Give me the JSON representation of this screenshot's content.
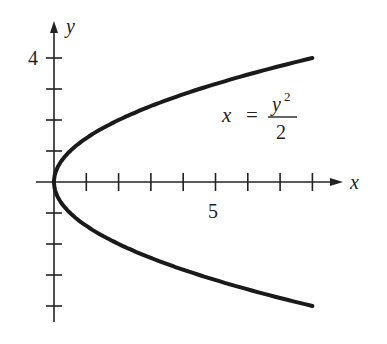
{
  "chart_data": {
    "type": "line",
    "title": "",
    "equation": {
      "lhs": "x",
      "eq": "=",
      "numerator": "y",
      "exponent": "2",
      "denominator": "2"
    },
    "xlabel": "x",
    "ylabel": "y",
    "x_tick_label": "5",
    "y_tick_label": "4",
    "xlim": [
      0,
      9
    ],
    "ylim": [
      -4.5,
      5
    ],
    "x_ticks": [
      1,
      2,
      3,
      4,
      5,
      6,
      7,
      8
    ],
    "y_ticks": [
      -4,
      -3,
      -2,
      -1,
      1,
      2,
      3,
      4
    ],
    "grid": false,
    "legend": "none",
    "series": [
      {
        "name": "x = y^2/2",
        "x": [
          8,
          4.5,
          2,
          0.5,
          0,
          0.5,
          2,
          4.5,
          8
        ],
        "y": [
          4,
          3,
          2,
          1,
          0,
          -1,
          -2,
          -3,
          -4
        ]
      }
    ],
    "color": "#1a1a1a"
  }
}
